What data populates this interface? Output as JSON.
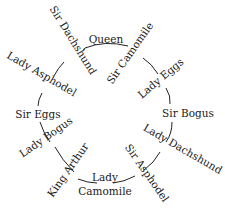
{
  "diagram": {
    "type": "circular-seating-arrangement",
    "nodes": [
      {
        "id": "queen",
        "label": "Queen"
      },
      {
        "id": "sir-camomile",
        "label": "Sir Camomile"
      },
      {
        "id": "lady-eggs",
        "label": "Lady Eggs"
      },
      {
        "id": "sir-bogus",
        "label": "Sir Bogus"
      },
      {
        "id": "lady-dachshund",
        "label": "Lady Dachshund"
      },
      {
        "id": "sir-asphodel",
        "label": "Sir Asphodel"
      },
      {
        "id": "lady-camomile",
        "label_line1": "Lady",
        "label_line2": "Camomile"
      },
      {
        "id": "king-arthur",
        "label": "King Arthur"
      },
      {
        "id": "lady-bogus",
        "label": "Lady Bogus"
      },
      {
        "id": "sir-eggs",
        "label": "Sir Eggs"
      },
      {
        "id": "lady-asphodel",
        "label": "Lady Asphodel"
      },
      {
        "id": "sir-dachshund",
        "label": "Sir Dachshund"
      }
    ],
    "edges": [
      [
        "queen",
        "sir-camomile"
      ],
      [
        "sir-camomile",
        "lady-eggs"
      ],
      [
        "lady-eggs",
        "sir-bogus"
      ],
      [
        "sir-bogus",
        "lady-dachshund"
      ],
      [
        "lady-dachshund",
        "sir-asphodel"
      ],
      [
        "sir-asphodel",
        "lady-camomile"
      ],
      [
        "lady-camomile",
        "king-arthur"
      ],
      [
        "king-arthur",
        "lady-bogus"
      ],
      [
        "lady-bogus",
        "sir-eggs"
      ],
      [
        "sir-eggs",
        "lady-asphodel"
      ],
      [
        "lady-asphodel",
        "sir-dachshund"
      ],
      [
        "sir-dachshund",
        "queen"
      ]
    ]
  }
}
